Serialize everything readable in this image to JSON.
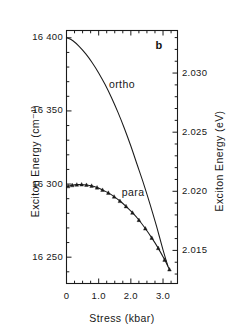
{
  "chart_data": {
    "type": "line",
    "title": "",
    "panel_label": "b",
    "xlabel": "Stress (kbar)",
    "ylabel": "Exciton Energy (cm⁻¹)",
    "ylabel_right": "Exciton Energy (eV)",
    "xlim": [
      0,
      3.45
    ],
    "ylim": [
      16232,
      16405
    ],
    "ylim_right": [
      2.0122,
      2.0336
    ],
    "grid": false,
    "legend": "inline-curve-labels",
    "xticks": [
      0,
      1.0,
      2.0,
      3.0
    ],
    "xticklabels": [
      "0",
      "1.0",
      "2.0",
      "3.0"
    ],
    "xminor_step": 0.25,
    "yticks": [
      16250,
      16300,
      16350,
      16400
    ],
    "yticklabels": [
      "16 250",
      "16 300",
      "16 350",
      "16 400"
    ],
    "yminor_step": 10,
    "yticks_right": [
      2.015,
      2.02,
      2.025,
      2.03
    ],
    "yticklabels_right": [
      "2.015",
      "2.020",
      "2.025",
      "2.030"
    ],
    "yminor_right_step": 0.001,
    "series": [
      {
        "name": "ortho",
        "label": "ortho",
        "style": "line",
        "marker": "none",
        "color": "#1a1a1a",
        "label_x": 1.32,
        "label_y": 16368,
        "x": [
          0.02,
          0.2,
          0.4,
          0.6,
          0.8,
          1.0,
          1.2,
          1.4,
          1.6,
          1.8,
          2.0,
          2.2,
          2.4,
          2.6,
          2.8,
          3.0,
          3.15
        ],
        "y": [
          16400,
          16398,
          16394,
          16389,
          16383,
          16376,
          16368,
          16359,
          16349,
          16338,
          16326,
          16313,
          16300,
          16286,
          16271,
          16255,
          16244
        ]
      },
      {
        "name": "para",
        "label": "para",
        "style": "line+markers",
        "marker": "triangle",
        "color": "#1a1a1a",
        "label_x": 1.72,
        "label_y": 16294,
        "x": [
          0.05,
          0.18,
          0.32,
          0.47,
          0.62,
          0.78,
          0.95,
          1.12,
          1.3,
          1.48,
          1.66,
          1.85,
          2.05,
          2.25,
          2.45,
          2.65,
          2.85,
          3.05,
          3.2
        ],
        "y": [
          16298.5,
          16299.2,
          16299.6,
          16299.7,
          16299.4,
          16298.8,
          16297.6,
          16296.0,
          16294.0,
          16291.4,
          16288.4,
          16284.8,
          16280.4,
          16275.4,
          16269.6,
          16263.2,
          16256.2,
          16248.2,
          16241.6
        ]
      }
    ]
  }
}
